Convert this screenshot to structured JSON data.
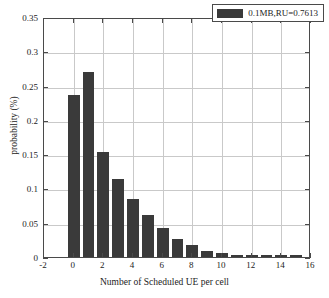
{
  "chart_data": {
    "type": "bar",
    "title": "",
    "xlabel": "Number of Scheduled UE per cell",
    "ylabel": "probability (%)",
    "xlim": [
      -2,
      16
    ],
    "ylim": [
      0,
      0.35
    ],
    "grid": true,
    "legend_position": "top-right",
    "xticks": [
      "-2",
      "0",
      "2",
      "4",
      "6",
      "8",
      "10",
      "12",
      "14",
      "16"
    ],
    "xtick_values": [
      -2,
      0,
      2,
      4,
      6,
      8,
      10,
      12,
      14,
      16
    ],
    "yticks": [
      "0",
      "0.05",
      "0.1",
      "0.15",
      "0.2",
      "0.25",
      "0.3",
      "0.35"
    ],
    "ytick_values": [
      0,
      0.05,
      0.1,
      0.15,
      0.2,
      0.25,
      0.3,
      0.35
    ],
    "bar_color": "#3a3a3a",
    "series": [
      {
        "name": "0.1MB,RU=0.7613",
        "categories": [
          0,
          1,
          2,
          3,
          4,
          5,
          6,
          7,
          8,
          9,
          10,
          11,
          12,
          13,
          14,
          15
        ],
        "values": [
          0.236,
          0.27,
          0.153,
          0.114,
          0.085,
          0.062,
          0.043,
          0.026,
          0.017,
          0.009,
          0.006,
          0.003,
          0.003,
          0.003,
          0.003,
          0.003
        ]
      }
    ]
  },
  "legend": {
    "entries": [
      {
        "label": "0.1MB,RU=0.7613",
        "color": "#3a3a3a"
      }
    ]
  },
  "axes": {
    "x_title": "Number of Scheduled UE per cell",
    "y_title": "probability (%)"
  }
}
